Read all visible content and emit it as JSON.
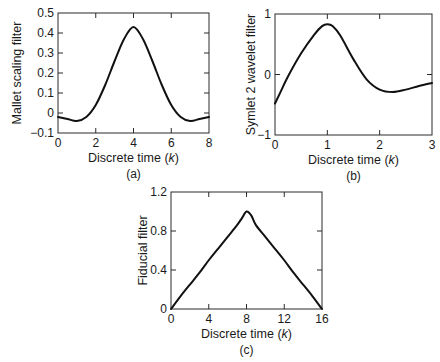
{
  "chart_data": [
    {
      "id": "a",
      "type": "line",
      "caption": "(a)",
      "title": "",
      "xlabel": "Discrete time (k)",
      "xlabel_parts": [
        "Discrete time (",
        "k",
        ")"
      ],
      "ylabel": "Mallet scaling filter",
      "xlim": [
        0,
        8
      ],
      "ylim": [
        -0.1,
        0.5
      ],
      "xticks": [
        0,
        2,
        4,
        6,
        8
      ],
      "yticks": [
        -0.1,
        0,
        0.1,
        0.2,
        0.3,
        0.4,
        0.5
      ],
      "xtick_labels": [
        "0",
        "2",
        "4",
        "6",
        "8"
      ],
      "ytick_labels": [
        "−0.1",
        "0",
        "0.1",
        "0.2",
        "0.3",
        "0.4",
        "0.5"
      ],
      "grid": false,
      "legend": null,
      "plot_box": {
        "left": 58,
        "right": 209,
        "top": 13,
        "bottom": 133
      },
      "series": [
        {
          "name": "Mallet scaling filter",
          "x": [
            0,
            0.5,
            1,
            1.5,
            2,
            2.5,
            3,
            3.5,
            4,
            4.5,
            5,
            5.5,
            6,
            6.5,
            7,
            7.5,
            8
          ],
          "y": [
            -0.02,
            -0.03,
            -0.04,
            -0.02,
            0.04,
            0.14,
            0.26,
            0.37,
            0.43,
            0.37,
            0.26,
            0.14,
            0.04,
            -0.02,
            -0.04,
            -0.03,
            -0.02
          ]
        }
      ]
    },
    {
      "id": "b",
      "type": "line",
      "caption": "(b)",
      "title": "",
      "xlabel": "Discrete time (k)",
      "xlabel_parts": [
        "Discrete time (",
        "k",
        ")"
      ],
      "ylabel": "Symlet 2 wavelet filter",
      "xlim": [
        0,
        3
      ],
      "ylim": [
        -1,
        1
      ],
      "xticks": [
        0,
        1,
        2,
        3
      ],
      "yticks": [
        -1,
        0,
        1
      ],
      "xtick_labels": [
        "0",
        "1",
        "2",
        "3"
      ],
      "ytick_labels": [
        "−1",
        "0",
        "1"
      ],
      "grid": false,
      "legend": null,
      "plot_box": {
        "left": 275,
        "right": 432,
        "top": 14,
        "bottom": 135
      },
      "series": [
        {
          "name": "Symlet 2 wavelet filter",
          "x": [
            0,
            0.1,
            0.25,
            0.5,
            0.75,
            0.9,
            1.0,
            1.1,
            1.25,
            1.5,
            1.75,
            2.0,
            2.25,
            2.5,
            2.75,
            3.0
          ],
          "y": [
            -0.48,
            -0.3,
            -0.03,
            0.35,
            0.66,
            0.8,
            0.83,
            0.8,
            0.64,
            0.25,
            -0.08,
            -0.25,
            -0.29,
            -0.25,
            -0.19,
            -0.14
          ]
        }
      ]
    },
    {
      "id": "c",
      "type": "line",
      "caption": "(c)",
      "title": "",
      "xlabel": "Discrete time (k)",
      "xlabel_parts": [
        "Discrete time (",
        "k",
        ")"
      ],
      "ylabel": "Fiducial filter",
      "xlim": [
        0,
        16
      ],
      "ylim": [
        0,
        1.2
      ],
      "xticks": [
        0,
        4,
        8,
        12,
        16
      ],
      "yticks": [
        0,
        0.4,
        0.8,
        1.2
      ],
      "xtick_labels": [
        "0",
        "4",
        "8",
        "12",
        "16"
      ],
      "ytick_labels": [
        "0",
        "0.4",
        "0.8",
        "1.2"
      ],
      "grid": false,
      "legend": null,
      "plot_box": {
        "left": 171,
        "right": 322,
        "top": 192,
        "bottom": 309
      },
      "series": [
        {
          "name": "Fiducial filter",
          "x": [
            0,
            1,
            2,
            3,
            4,
            5,
            6,
            7,
            7.5,
            8,
            8.5,
            9,
            10,
            11,
            12,
            13,
            14,
            15,
            16
          ],
          "y": [
            0,
            0.13,
            0.25,
            0.37,
            0.5,
            0.62,
            0.74,
            0.86,
            0.93,
            1.0,
            0.96,
            0.86,
            0.74,
            0.62,
            0.5,
            0.37,
            0.25,
            0.13,
            0
          ]
        }
      ]
    }
  ]
}
